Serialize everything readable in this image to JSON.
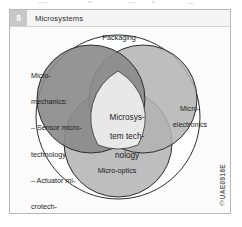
{
  "figure": {
    "number": "8",
    "title": "Microsystems"
  },
  "diagram": {
    "type": "venn",
    "outer_label": "Packaging",
    "center_label_lines": [
      "Microsys-",
      "tem tech-",
      "nology"
    ],
    "circles": [
      {
        "name": "micro-mechanics",
        "label_lines": [
          "Micro-",
          "mechanics:",
          "– Sensor micro-",
          "technology",
          "– Actuator mi-",
          "crotech-",
          "nology"
        ],
        "fill": "#8f8f8f"
      },
      {
        "name": "micro-electronics",
        "label_lines": [
          "Micro-",
          "electronics"
        ],
        "fill": "#b3b3b3"
      },
      {
        "name": "micro-optics",
        "label_lines": [
          "Micro-optics"
        ],
        "fill": "#b3b3b3"
      }
    ],
    "outer_fill": "#ffffff",
    "center_fill": "#f2f2f2",
    "stroke": "#2e2e2e"
  },
  "imprint": {
    "code": "UAE0916E",
    "mark": "©"
  },
  "colors": {
    "frame_border": "#b9b9b9",
    "header_background": "#f4f4f4",
    "number_badge": "#c8c8c8",
    "canvas_background": "#fbfbfb",
    "text": "#1c1c1c"
  }
}
